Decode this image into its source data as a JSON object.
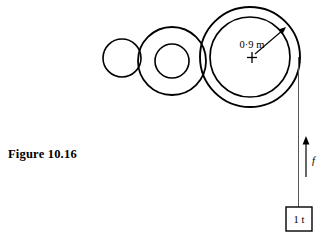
{
  "figure": {
    "caption": "Figure 10.16",
    "background_color": "#ffffff",
    "stroke_color": "#000000"
  },
  "labels": {
    "radius_dimension": "0·9 m",
    "force_symbol": "f",
    "load_value": "1 t"
  },
  "diagram": {
    "type": "pulley-hoist-drum-assembly",
    "elements": [
      {
        "name": "small-pulley",
        "shape": "circle",
        "cx": 122,
        "cy": 58,
        "r": 19,
        "stroke_width": 1.6
      },
      {
        "name": "middle-pulley-outer",
        "shape": "circle",
        "cx": 172,
        "cy": 61,
        "r": 34,
        "stroke_width": 1.8
      },
      {
        "name": "middle-pulley-inner",
        "shape": "circle",
        "cx": 172,
        "cy": 61,
        "r": 17,
        "stroke_width": 1.6
      },
      {
        "name": "large-drum-outer",
        "shape": "circle",
        "cx": 250,
        "cy": 57,
        "r": 50,
        "stroke_width": 1.9
      },
      {
        "name": "large-drum-inner",
        "shape": "circle",
        "cx": 250,
        "cy": 57,
        "r": 40,
        "stroke_width": 1.7
      },
      {
        "name": "drum-center-cross",
        "shape": "cross",
        "cx": 252,
        "cy": 57,
        "arm": 5
      },
      {
        "name": "radius-arrow",
        "shape": "arrow",
        "x1": 254,
        "y1": 55,
        "x2": 285,
        "y2": 28
      },
      {
        "name": "rope-line",
        "shape": "line",
        "x1": 298,
        "y1": 57,
        "x2": 298,
        "y2": 207,
        "stroke_width": 0.9
      },
      {
        "name": "force-arrow",
        "shape": "arrow",
        "x1": 306,
        "y1": 176,
        "x2": 306,
        "y2": 138
      },
      {
        "name": "load-box",
        "shape": "rect",
        "x": 286,
        "y": 207,
        "width": 26,
        "height": 24,
        "stroke_width": 1.4
      }
    ],
    "dimension_label_position": {
      "x": 252,
      "y": 47
    },
    "force_label_position": {
      "x": 312,
      "y": 163
    },
    "load_label_position": {
      "x": 299,
      "y": 223
    }
  }
}
